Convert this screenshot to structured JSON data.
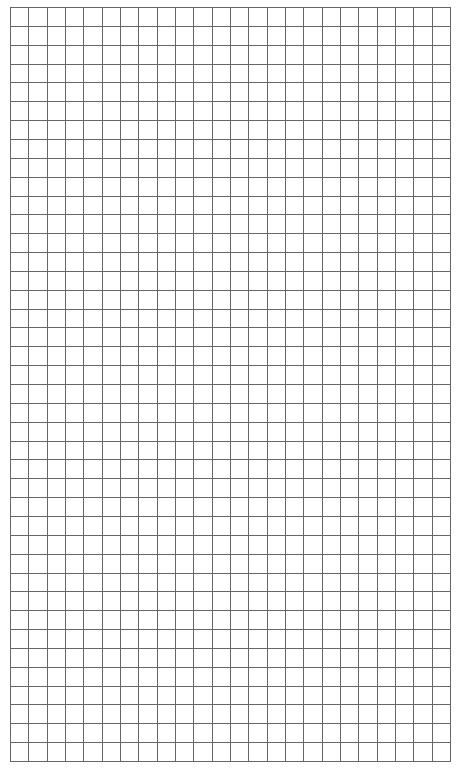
{
  "grid": {
    "columns": 24,
    "rows": 40,
    "left": 10,
    "top": 7,
    "width": 441,
    "height": 755,
    "line_color": "#666666",
    "background_color": "#ffffff"
  }
}
